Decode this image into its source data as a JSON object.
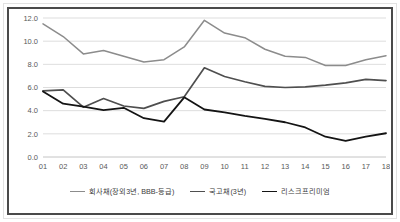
{
  "chart_data": {
    "type": "line",
    "title": "",
    "subtitle": "",
    "xlabel": "",
    "ylabel": "",
    "categories": [
      "01",
      "02",
      "03",
      "04",
      "05",
      "06",
      "07",
      "08",
      "09",
      "10",
      "11",
      "12",
      "13",
      "14",
      "15",
      "16",
      "17",
      "18"
    ],
    "ylim": [
      0.0,
      12.0
    ],
    "yticks": [
      "0.0",
      "2.0",
      "4.0",
      "6.0",
      "8.0",
      "10.0",
      "12.0"
    ],
    "ytick_values": [
      0.0,
      2.0,
      4.0,
      6.0,
      8.0,
      10.0,
      12.0
    ],
    "grid": "horizontal",
    "legend_position": "bottom",
    "series": [
      {
        "name": "회사채(장외3년, BBB-등급)",
        "color": "#8c8c8c",
        "width": 1.5,
        "values": [
          11.5,
          10.4,
          8.9,
          9.2,
          8.7,
          8.2,
          8.4,
          9.5,
          11.8,
          10.7,
          10.3,
          9.3,
          8.7,
          8.6,
          7.9,
          7.9,
          8.4,
          8.75
        ]
      },
      {
        "name": "국고채(3년)",
        "color": "#4f4f4f",
        "width": 1.7,
        "values": [
          5.7,
          5.8,
          4.3,
          5.05,
          4.4,
          4.2,
          4.8,
          5.2,
          7.7,
          6.95,
          6.5,
          6.1,
          6.0,
          6.05,
          6.2,
          6.4,
          6.7,
          6.6
        ]
      },
      {
        "name": "리스크프리미엄",
        "color": "#141414",
        "width": 1.8,
        "values": [
          5.65,
          4.6,
          4.35,
          4.05,
          4.25,
          3.35,
          3.05,
          5.15,
          4.1,
          3.85,
          3.55,
          3.3,
          3.0,
          2.55,
          1.75,
          1.4,
          1.75,
          2.05
        ]
      }
    ]
  },
  "frame": {
    "border_color": "#4a4a4a",
    "outer_border_color": "#e2e2e2",
    "background": "#ffffff"
  }
}
